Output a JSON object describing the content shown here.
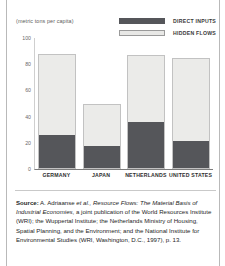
{
  "chart_data": {
    "type": "bar",
    "stacked": true,
    "title": "",
    "subtitle": "",
    "xlabel": "",
    "ylabel": "(metric tons per capita)",
    "axis_unit": "(metric tons per capita)",
    "categories": [
      "GERMANY",
      "JAPAN",
      "NETHERLANDS",
      "UNITED STATES"
    ],
    "series": [
      {
        "name": "DIRECT INPUTS",
        "color": "#55565a",
        "values": [
          26,
          17,
          36,
          21
        ]
      },
      {
        "name": "HIDDEN FLOWS",
        "color": "#ebebe9",
        "values": [
          62,
          33,
          51,
          64
        ]
      }
    ],
    "totals": [
      88,
      50,
      87,
      85
    ],
    "yticks": [
      "100",
      "80",
      "60",
      "40",
      "20",
      "0"
    ],
    "ylim": [
      0,
      100
    ],
    "grid": false,
    "legend_position": "top-right"
  },
  "legend": {
    "items": [
      {
        "label": "DIRECT INPUTS",
        "swatch": "dark"
      },
      {
        "label": "HIDDEN FLOWS",
        "swatch": "light"
      }
    ]
  },
  "source": {
    "label": "Source:",
    "text_part1": " A. Adriaanse ",
    "italic1": "et al., Resource Flows: The Material Basis of Industrial Economies",
    "text_part2": ", a joint publication of the World Resources Institute (WRI); the Wuppertal Institute; the Netherlands Ministry of Housing, Spatial Planning, and the Environment; and the National Institute for Environmental Studies (WRI, Washington, D.C., 1997), p. 13."
  }
}
